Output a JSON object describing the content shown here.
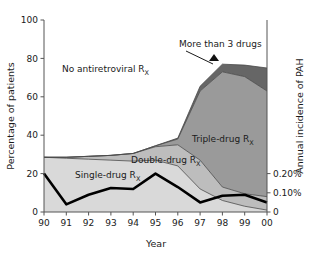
{
  "chart_data": {
    "type": "area",
    "title": "",
    "xlabel": "Year",
    "ylabel": "Percentage of patients",
    "y2label": "Annual incidence of PAH",
    "x": [
      "90",
      "91",
      "92",
      "93",
      "94",
      "95",
      "96",
      "97",
      "98",
      "99",
      "00"
    ],
    "categories": [
      "90",
      "91",
      "92",
      "93",
      "94",
      "95",
      "96",
      "97",
      "98",
      "99",
      "00"
    ],
    "xlim": [
      0,
      10
    ],
    "ylim": [
      0,
      100
    ],
    "y2lim": [
      0,
      0.5
    ],
    "yticks": [
      0,
      20,
      40,
      60,
      80,
      100
    ],
    "ytick_labels": [
      "0",
      "20",
      "40",
      "60",
      "80",
      "100"
    ],
    "y2ticks": [
      0,
      0.1,
      0.2
    ],
    "y2tick_labels": [
      "0",
      "0.10%",
      "0.20%"
    ],
    "grid": false,
    "legend_position": "inline-annotations",
    "stacking": "stacked-from-bottom",
    "series": [
      {
        "name": "Single-drug Rx",
        "label": "Single-drug R",
        "label_sub": "X",
        "color": "#d9d9d9",
        "values": [
          28.5,
          28.0,
          27.5,
          27.0,
          26.5,
          27.0,
          24.0,
          12.0,
          6.0,
          3.0,
          1.0
        ]
      },
      {
        "name": "Double-drug Rx",
        "label": "Double-drug R",
        "label_sub": "X",
        "color": "#bdbdbd",
        "values": [
          0.0,
          0.5,
          1.5,
          2.5,
          4.0,
          7.0,
          11.0,
          15.0,
          7.0,
          6.5,
          7.0
        ]
      },
      {
        "name": "Triple-drug Rx",
        "label": "Triple-drug R",
        "label_sub": "X",
        "color": "#9a9a9a",
        "values": [
          0.0,
          0.0,
          0.0,
          0.0,
          0.0,
          0.5,
          3.0,
          36.0,
          60.0,
          61.0,
          55.0
        ]
      },
      {
        "name": "More than 3 drugs",
        "label": "More than 3 drugs",
        "color": "#666666",
        "values": [
          0.0,
          0.0,
          0.0,
          0.0,
          0.0,
          0.0,
          0.5,
          2.5,
          4.0,
          6.0,
          12.0
        ]
      }
    ],
    "unfilled_region": {
      "name": "No antiretroviral Rx",
      "label": "No antiretroviral R",
      "label_sub": "X",
      "color": "#ffffff"
    },
    "overlay_line": {
      "name": "Annual incidence of PAH",
      "color": "#000000",
      "axis": "right",
      "values_percent_scale": [
        20.0,
        4.0,
        9.0,
        12.5,
        12.0,
        20.0,
        13.0,
        5.0,
        8.5,
        9.0,
        5.0
      ],
      "values_right_axis": [
        0.2,
        0.04,
        0.09,
        0.125,
        0.12,
        0.2,
        0.13,
        0.05,
        0.085,
        0.09,
        0.05
      ]
    },
    "annotations": [
      {
        "name": "more-than-3-drugs-callout",
        "text": "More than 3 drugs",
        "marker": "triangle"
      }
    ]
  }
}
